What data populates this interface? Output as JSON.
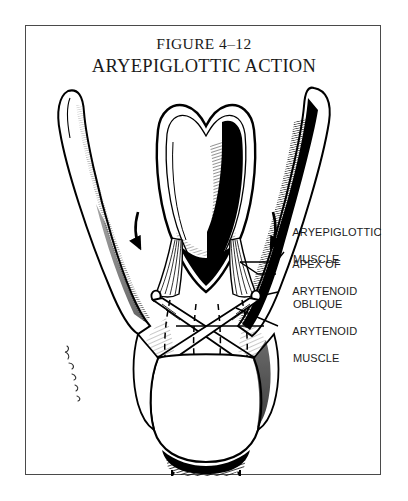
{
  "figure": {
    "caption_line_1": "FIGURE 4–12",
    "caption_line_2": "ARYEPIGLOTTIC ACTION",
    "frame_color": "#4a4a4a",
    "ink_color": "#000000",
    "background_color": "#ffffff"
  },
  "labels": [
    {
      "id": "aryepiglottic-muscle",
      "line_1": "ARYEPIGLOTTIC",
      "line_2": "MUSCLE"
    },
    {
      "id": "apex-of-arytenoid",
      "line_1": "APEX OF",
      "line_2": "ARYTENOID"
    },
    {
      "id": "oblique-arytenoid-muscle",
      "line_1": "OBLIQUE",
      "line_2": "ARYTENOID",
      "line_3": "MUSCLE"
    }
  ],
  "artist_signature": {
    "text": "Ridenour",
    "orientation": "vertical"
  },
  "anatomy": {
    "epiglottis": "epiglottis-shield",
    "left_superior_horn": "thyroid-superior-horn-left",
    "right_superior_horn": "thyroid-superior-horn-right",
    "cricoid": "cricoid-cartilage",
    "trachea": "trachea",
    "oblique_arytenoid_crossing": "x-crossing-muscles",
    "action_arrows": 2
  }
}
